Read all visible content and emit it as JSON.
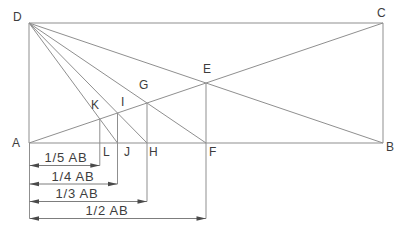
{
  "diagram": {
    "colors": {
      "background": "#ffffff",
      "line": "#8f8f8f",
      "text": "#3d3d3d",
      "arrow": "#4a4a4a"
    },
    "points": {
      "A": "A",
      "B": "B",
      "C": "C",
      "D": "D",
      "E": "E",
      "F": "F",
      "G": "G",
      "H": "H",
      "I": "I",
      "J": "J",
      "K": "K",
      "L": "L"
    },
    "dimensions": [
      {
        "label": "1/5 AB"
      },
      {
        "label": "1/4 AB"
      },
      {
        "label": "1/3 AB"
      },
      {
        "label": "1/2 AB"
      }
    ]
  }
}
